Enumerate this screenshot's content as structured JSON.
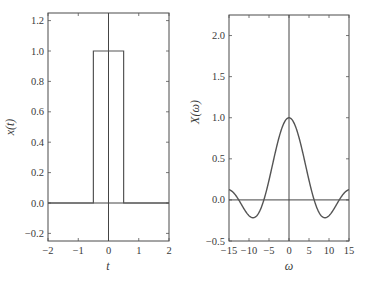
{
  "chart_data": [
    {
      "type": "line",
      "title": "",
      "xlabel": "t",
      "ylabel": "x(t)",
      "xlim": [
        -2,
        2
      ],
      "ylim": [
        -0.25,
        1.25
      ],
      "xticks": [
        "−2",
        "−1",
        "0",
        "1",
        "2"
      ],
      "yticks": [
        "−0.2",
        "0.0",
        "0.2",
        "0.4",
        "0.6",
        "0.8",
        "1.0",
        "1.2"
      ],
      "grid": false,
      "series": [
        {
          "name": "x(t) rectangular pulse",
          "x": [
            -2,
            -0.5,
            -0.5,
            0.5,
            0.5,
            2
          ],
          "y": [
            0,
            0,
            1,
            1,
            0,
            0
          ]
        }
      ]
    },
    {
      "type": "line",
      "title": "",
      "xlabel": "ω",
      "ylabel": "X(ω)",
      "xlim": [
        -15,
        15
      ],
      "ylim": [
        -0.5,
        2.25
      ],
      "xticks": [
        "−15",
        "−10",
        "−5",
        "0",
        "5",
        "10",
        "15"
      ],
      "yticks": [
        "−0.5",
        "0.0",
        "0.5",
        "1.0",
        "1.5",
        "2.0"
      ],
      "grid": false,
      "series": [
        {
          "name": "X(ω) = sin(ω/2)/(ω/2)",
          "x": [
            -15,
            -12.57,
            -10,
            -8.99,
            -6.28,
            -4,
            -2,
            0,
            2,
            4,
            6.28,
            8.99,
            10,
            12.57,
            15
          ],
          "y": [
            0.125,
            0,
            -0.192,
            -0.217,
            0,
            0.455,
            0.841,
            1.0,
            0.841,
            0.455,
            0,
            -0.217,
            -0.192,
            0,
            0.125
          ]
        }
      ]
    }
  ]
}
